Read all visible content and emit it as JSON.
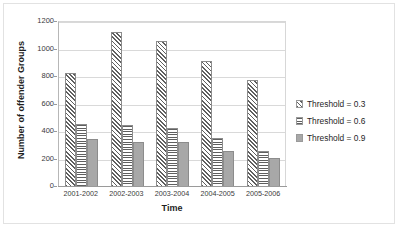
{
  "chart_data": {
    "type": "bar",
    "title": "",
    "xlabel": "Time",
    "ylabel": "Number of offender Groups",
    "categories": [
      "2001-2002",
      "2002-2003",
      "2003-2004",
      "2004-2005",
      "2005-2006"
    ],
    "series": [
      {
        "name": "Threshold = 0.3",
        "values": [
          820,
          1120,
          1055,
          910,
          770
        ],
        "pattern": "diagonal-hatch",
        "color": "#5f5f5f"
      },
      {
        "name": "Threshold = 0.6",
        "values": [
          450,
          445,
          425,
          350,
          255
        ],
        "pattern": "horizontal-lines",
        "color": "#5f5f5f"
      },
      {
        "name": "Threshold = 0.9",
        "values": [
          345,
          320,
          320,
          255,
          205
        ],
        "pattern": "solid",
        "color": "#a8a8a8"
      }
    ],
    "ylim": [
      0,
      1200
    ],
    "ytick_step": 200,
    "yticks": [
      "1200",
      "1000",
      "800",
      "600",
      "400",
      "200",
      "0"
    ],
    "grid": "horizontal",
    "legend_position": "right"
  },
  "legend": {
    "items": [
      {
        "label": "Threshold = 0.3"
      },
      {
        "label": "Threshold = 0.6"
      },
      {
        "label": "Threshold = 0.9"
      }
    ]
  }
}
